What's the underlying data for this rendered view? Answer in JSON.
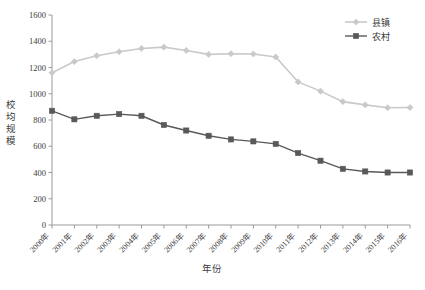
{
  "chart_data": {
    "type": "line",
    "title": "",
    "xlabel": "年份",
    "ylabel": "校均规模",
    "categories": [
      "2000年",
      "2001年",
      "2002年",
      "2003年",
      "2004年",
      "2005年",
      "2006年",
      "2007年",
      "2008年",
      "2009年",
      "2010年",
      "2011年",
      "2012年",
      "2013年",
      "2014年",
      "2015年",
      "2016年"
    ],
    "x_values": [
      2000,
      2001,
      2002,
      2003,
      2004,
      2005,
      2006,
      2007,
      2008,
      2009,
      2010,
      2011,
      2012,
      2013,
      2014,
      2015,
      2016
    ],
    "ylim": [
      0,
      1600
    ],
    "yticks": [
      0,
      200,
      400,
      600,
      800,
      1000,
      1200,
      1400,
      1600
    ],
    "ytick_labels": [
      "0",
      "200",
      "400",
      "600",
      "800",
      "1000",
      "1200",
      "1400",
      "1600"
    ],
    "grid": false,
    "legend_position": "top-right",
    "series": [
      {
        "name": "县镇",
        "color": "#c9c9c9",
        "marker": "diamond",
        "values": [
          1160,
          1245,
          1290,
          1320,
          1345,
          1355,
          1330,
          1300,
          1305,
          1303,
          1280,
          1090,
          1020,
          940,
          915,
          893,
          895
        ]
      },
      {
        "name": "农村",
        "color": "#595959",
        "marker": "square",
        "values": [
          870,
          805,
          832,
          845,
          832,
          762,
          720,
          680,
          652,
          637,
          618,
          548,
          490,
          428,
          408,
          400,
          400
        ]
      }
    ]
  },
  "legend": {
    "items": [
      {
        "label": "县镇"
      },
      {
        "label": "农村"
      }
    ]
  },
  "axes": {
    "y_title": "校均规模",
    "x_title": "年份"
  }
}
